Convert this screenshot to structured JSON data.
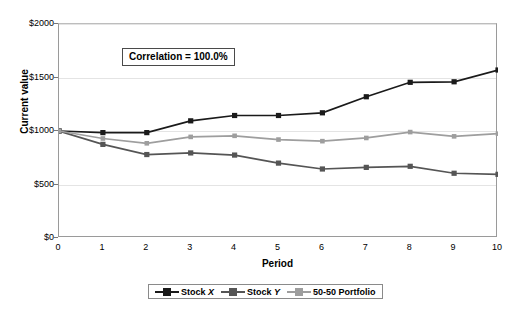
{
  "chart_data": {
    "type": "line",
    "title": "",
    "xlabel": "Period",
    "ylabel": "Current value",
    "x": [
      0,
      1,
      2,
      3,
      4,
      5,
      6,
      7,
      8,
      9,
      10
    ],
    "xtick_labels": [
      "0",
      "1",
      "2",
      "3",
      "4",
      "5",
      "6",
      "7",
      "8",
      "9",
      "10"
    ],
    "ytick_labels": [
      "$0",
      "$500",
      "$1000",
      "$1500",
      "$2000"
    ],
    "ytick_values": [
      0,
      500,
      1000,
      1500,
      2000
    ],
    "xlim": [
      0,
      10
    ],
    "ylim": [
      0,
      2000
    ],
    "grid": "horizontal",
    "legend_position": "bottom",
    "annotation": "Correlation = 100.0%",
    "series": [
      {
        "name": "Stock X",
        "color": "#1a1a1a",
        "marker": "square",
        "values": [
          1000,
          985,
          985,
          1095,
          1145,
          1145,
          1170,
          1320,
          1455,
          1460,
          1570
        ]
      },
      {
        "name": "Stock Y",
        "color": "#555555",
        "marker": "square",
        "values": [
          1000,
          875,
          780,
          795,
          775,
          700,
          645,
          660,
          670,
          605,
          595
        ]
      },
      {
        "name": "50-50 Portfolio",
        "color": "#9e9e9e",
        "marker": "square",
        "values": [
          1000,
          930,
          885,
          945,
          955,
          920,
          905,
          935,
          990,
          950,
          975
        ]
      }
    ]
  },
  "legend": {
    "items": [
      {
        "label_main": "Stock ",
        "label_italic": "X"
      },
      {
        "label_main": "Stock ",
        "label_italic": "Y"
      },
      {
        "label_main": "50-50 Portfolio",
        "label_italic": ""
      }
    ]
  }
}
